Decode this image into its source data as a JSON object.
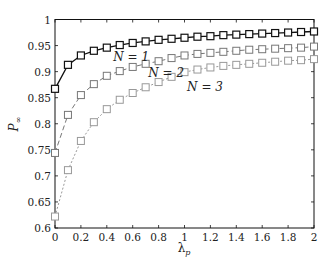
{
  "chart_data": {
    "type": "line",
    "title": "",
    "xlabel": "λ",
    "xlabel_sub": "p",
    "ylabel": "P",
    "ylabel_sub": "∞",
    "xlim": [
      0,
      2
    ],
    "ylim": [
      0.6,
      1
    ],
    "xticks": [
      0,
      0.2,
      0.4,
      0.6,
      0.8,
      1,
      1.2,
      1.4,
      1.6,
      1.8,
      2
    ],
    "xtick_labels": [
      "0",
      "0.2",
      "0.4",
      "0.6",
      "0.8",
      "1",
      "1.2",
      "1.4",
      "1.6",
      "1.8",
      "2"
    ],
    "yticks": [
      0.6,
      0.65,
      0.7,
      0.75,
      0.8,
      0.85,
      0.9,
      0.95,
      1
    ],
    "ytick_labels": [
      "0.6",
      "0.65",
      "0.7",
      "0.75",
      "0.8",
      "0.85",
      "0.9",
      "0.95",
      "1"
    ],
    "grid": false,
    "legend": "none",
    "x": [
      0,
      0.1,
      0.2,
      0.3,
      0.4,
      0.5,
      0.6,
      0.7,
      0.8,
      0.9,
      1.0,
      1.1,
      1.2,
      1.3,
      1.4,
      1.5,
      1.6,
      1.7,
      1.8,
      1.9,
      2.0
    ],
    "series": [
      {
        "name": "N=1",
        "color": "#111111",
        "dash": "solid",
        "marker": "square",
        "values": [
          0.867,
          0.913,
          0.931,
          0.94,
          0.946,
          0.951,
          0.955,
          0.958,
          0.961,
          0.963,
          0.965,
          0.967,
          0.968,
          0.97,
          0.971,
          0.972,
          0.973,
          0.974,
          0.975,
          0.976,
          0.977
        ]
      },
      {
        "name": "N=2",
        "color": "#777777",
        "dash": "dashed",
        "marker": "square",
        "values": [
          0.744,
          0.817,
          0.855,
          0.876,
          0.892,
          0.901,
          0.909,
          0.915,
          0.92,
          0.926,
          0.931,
          0.934,
          0.936,
          0.938,
          0.94,
          0.942,
          0.943,
          0.944,
          0.945,
          0.946,
          0.948
        ]
      },
      {
        "name": "N=3",
        "color": "#999999",
        "dash": "dotted",
        "marker": "square",
        "values": [
          0.622,
          0.711,
          0.767,
          0.803,
          0.828,
          0.846,
          0.859,
          0.87,
          0.88,
          0.89,
          0.899,
          0.904,
          0.908,
          0.911,
          0.913,
          0.915,
          0.917,
          0.919,
          0.921,
          0.922,
          0.924
        ]
      }
    ],
    "annotations": [
      {
        "text": "N = 1",
        "x": 0.45,
        "y": 0.92
      },
      {
        "text": "N = 2",
        "x": 0.72,
        "y": 0.89
      },
      {
        "text": "N = 3",
        "x": 1.02,
        "y": 0.862
      }
    ]
  }
}
